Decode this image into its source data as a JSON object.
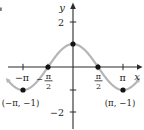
{
  "figure": {
    "background": "#ffffff",
    "curve_color": "#b5b5b5",
    "axis_color": "#2b2b2b",
    "point_color": "#141414",
    "text_color": "#1c1c1c",
    "artifact_color": "#777777"
  },
  "axes": {
    "x_label": "x",
    "y_label": "y",
    "x_ticks": [
      {
        "value": -3.1416,
        "label": "−π"
      },
      {
        "value": -1.5708,
        "label": "−π/2",
        "sign": "−",
        "numerator": "π",
        "denominator": "2"
      },
      {
        "value": 1.5708,
        "label": "π/2",
        "sign": "",
        "numerator": "π",
        "denominator": "2"
      },
      {
        "value": 3.1416,
        "label": "π"
      }
    ],
    "y_ticks": [
      {
        "value": 2,
        "label": "2"
      },
      {
        "value": -1,
        "label": ""
      },
      {
        "value": -2,
        "label": "−2"
      }
    ]
  },
  "chart_data": {
    "type": "line",
    "function_plotted": "cos",
    "series": [
      {
        "function": "cos",
        "x_min_rad": -4.08,
        "x_max_rad": 4.08,
        "amplitude": 1,
        "period_rad": 6.2832
      }
    ],
    "marked_points": [
      {
        "x_rad": -3.1416,
        "y": -1,
        "label": "(−π, −1)"
      },
      {
        "x_rad": -1.5708,
        "y": 0,
        "label": ""
      },
      {
        "x_rad": 0,
        "y": 1,
        "label": ""
      },
      {
        "x_rad": 1.5708,
        "y": 0,
        "label": ""
      },
      {
        "x_rad": 3.1416,
        "y": -1,
        "label": "(π, −1)"
      }
    ],
    "xlim_rad": [
      -4.6,
      4.45
    ],
    "ylim": [
      -2.8,
      2.9
    ],
    "grid": false,
    "legend": false
  }
}
